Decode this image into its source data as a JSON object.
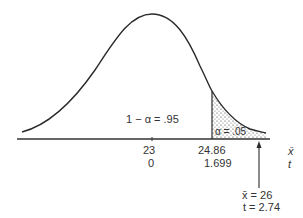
{
  "diagram": {
    "type": "t-distribution one-tailed test",
    "region_labels": {
      "acceptance": "1 − α = .95",
      "rejection": "α = .05"
    },
    "axis_labels": {
      "xbar": "x̄",
      "t": "t"
    },
    "ticks": [
      {
        "xbar": "23",
        "t": "0"
      },
      {
        "xbar": "24.86",
        "t": "1.699"
      }
    ],
    "observed": {
      "xbar": "x̄ = 26",
      "t": "t = 2.74"
    }
  }
}
